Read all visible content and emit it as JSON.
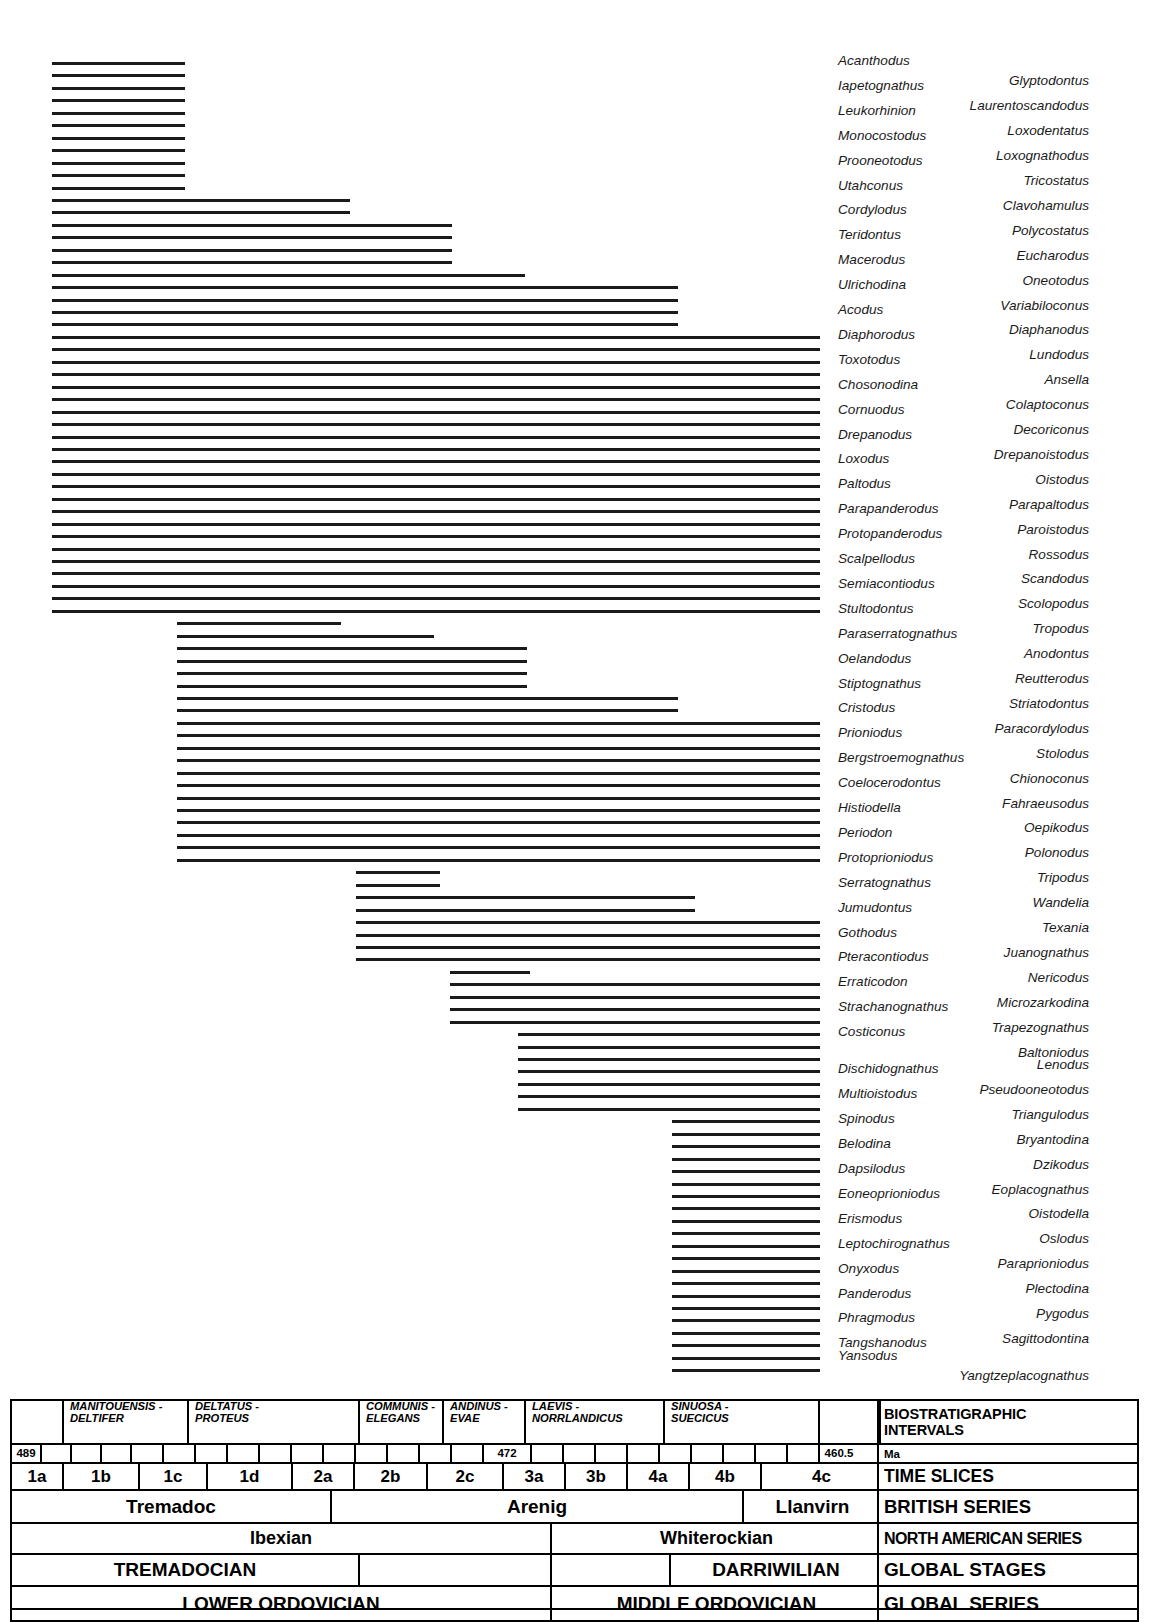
{
  "chart_data": {
    "type": "range-chart",
    "xlabel": "Time Slices",
    "x_axis_px": {
      "left": 52,
      "right": 1139
    },
    "axis_ma": [
      489,
      472,
      460.5
    ],
    "taxa": [
      {
        "name": "Acanthodus",
        "column": "left",
        "start": 52,
        "end": 185
      },
      {
        "name": "Glyptodontus",
        "column": "right",
        "start": 52,
        "end": 185
      },
      {
        "name": "Iapetognathus",
        "column": "left",
        "start": 52,
        "end": 185
      },
      {
        "name": "Laurentoscandodus",
        "column": "right",
        "start": 52,
        "end": 185
      },
      {
        "name": "Leukorhinion",
        "column": "left",
        "start": 52,
        "end": 185
      },
      {
        "name": "Loxodentatus",
        "column": "right",
        "start": 52,
        "end": 185
      },
      {
        "name": "Monocostodus",
        "column": "left",
        "start": 52,
        "end": 185
      },
      {
        "name": "Loxognathodus",
        "column": "right",
        "start": 52,
        "end": 185
      },
      {
        "name": "Prooneotodus",
        "column": "left",
        "start": 52,
        "end": 185
      },
      {
        "name": "Tricostatus",
        "column": "right",
        "start": 52,
        "end": 185
      },
      {
        "name": "Utahconus",
        "column": "left",
        "start": 52,
        "end": 185
      },
      {
        "name": "Clavohamulus",
        "column": "right",
        "start": 52,
        "end": 350
      },
      {
        "name": "Cordylodus",
        "column": "left",
        "start": 52,
        "end": 350
      },
      {
        "name": "Polycostatus",
        "column": "right",
        "start": 52,
        "end": 452
      },
      {
        "name": "Teridontus",
        "column": "left",
        "start": 52,
        "end": 452
      },
      {
        "name": "Eucharodus",
        "column": "right",
        "start": 52,
        "end": 452
      },
      {
        "name": "Macerodus",
        "column": "left",
        "start": 52,
        "end": 452
      },
      {
        "name": "Oneotodus",
        "column": "right",
        "start": 52,
        "end": 525
      },
      {
        "name": "Ulrichodina",
        "column": "left",
        "start": 52,
        "end": 678
      },
      {
        "name": "Variabiloconus",
        "column": "right",
        "start": 52,
        "end": 678
      },
      {
        "name": "Acodus",
        "column": "left",
        "start": 52,
        "end": 678
      },
      {
        "name": "Diaphanodus",
        "column": "right",
        "start": 52,
        "end": 678
      },
      {
        "name": "Diaphorodus",
        "column": "left",
        "start": 52,
        "end": 820
      },
      {
        "name": "Lundodus",
        "column": "right",
        "start": 52,
        "end": 820
      },
      {
        "name": "Toxotodus",
        "column": "left",
        "start": 52,
        "end": 820
      },
      {
        "name": "Ansella",
        "column": "right",
        "start": 52,
        "end": 820
      },
      {
        "name": "Chosonodina",
        "column": "left",
        "start": 52,
        "end": 820
      },
      {
        "name": "Colaptoconus",
        "column": "right",
        "start": 52,
        "end": 820
      },
      {
        "name": "Cornuodus",
        "column": "left",
        "start": 52,
        "end": 820
      },
      {
        "name": "Decoriconus",
        "column": "right",
        "start": 52,
        "end": 820
      },
      {
        "name": "Drepanodus",
        "column": "left",
        "start": 52,
        "end": 820
      },
      {
        "name": "Drepanoistodus",
        "column": "right",
        "start": 52,
        "end": 820
      },
      {
        "name": "Loxodus",
        "column": "left",
        "start": 52,
        "end": 820
      },
      {
        "name": "Oistodus",
        "column": "right",
        "start": 52,
        "end": 820
      },
      {
        "name": "Paltodus",
        "column": "left",
        "start": 52,
        "end": 820
      },
      {
        "name": "Parapaltodus",
        "column": "right",
        "start": 52,
        "end": 820
      },
      {
        "name": "Parapanderodus",
        "column": "left",
        "start": 52,
        "end": 820
      },
      {
        "name": "Paroistodus",
        "column": "right",
        "start": 52,
        "end": 820
      },
      {
        "name": "Protopanderodus",
        "column": "left",
        "start": 52,
        "end": 820
      },
      {
        "name": "Rossodus",
        "column": "right",
        "start": 52,
        "end": 820
      },
      {
        "name": "Scalpellodus",
        "column": "left",
        "start": 52,
        "end": 820
      },
      {
        "name": "Scandodus",
        "column": "right",
        "start": 52,
        "end": 820
      },
      {
        "name": "Semiacontiodus",
        "column": "left",
        "start": 52,
        "end": 820
      },
      {
        "name": "Scolopodus",
        "column": "right",
        "start": 52,
        "end": 820
      },
      {
        "name": "Stultodontus",
        "column": "left",
        "start": 52,
        "end": 820
      },
      {
        "name": "Tropodus",
        "column": "right",
        "start": 177,
        "end": 341
      },
      {
        "name": "Paraserratognathus",
        "column": "left",
        "start": 177,
        "end": 434
      },
      {
        "name": "Anodontus",
        "column": "right",
        "start": 177,
        "end": 527
      },
      {
        "name": "Oelandodus",
        "column": "left",
        "start": 177,
        "end": 527
      },
      {
        "name": "Reutterodus",
        "column": "right",
        "start": 177,
        "end": 527
      },
      {
        "name": "Stiptognathus",
        "column": "left",
        "start": 177,
        "end": 527
      },
      {
        "name": "Striatodontus",
        "column": "right",
        "start": 177,
        "end": 678
      },
      {
        "name": "Cristodus",
        "column": "left",
        "start": 177,
        "end": 678
      },
      {
        "name": "Paracordylodus",
        "column": "right",
        "start": 177,
        "end": 820
      },
      {
        "name": "Prioniodus",
        "column": "left",
        "start": 177,
        "end": 820
      },
      {
        "name": "Stolodus",
        "column": "right",
        "start": 177,
        "end": 820
      },
      {
        "name": "Bergstroemognathus",
        "column": "left",
        "start": 177,
        "end": 820
      },
      {
        "name": "Chionoconus",
        "column": "right",
        "start": 177,
        "end": 820
      },
      {
        "name": "Coelocerodontus",
        "column": "left",
        "start": 177,
        "end": 820
      },
      {
        "name": "Fahraeusodus",
        "column": "right",
        "start": 177,
        "end": 820
      },
      {
        "name": "Histiodella",
        "column": "left",
        "start": 177,
        "end": 820
      },
      {
        "name": "Oepikodus",
        "column": "right",
        "start": 177,
        "end": 820
      },
      {
        "name": "Periodon",
        "column": "left",
        "start": 177,
        "end": 820
      },
      {
        "name": "Polonodus",
        "column": "right",
        "start": 177,
        "end": 820
      },
      {
        "name": "Protoprioniodus",
        "column": "left",
        "start": 177,
        "end": 820
      },
      {
        "name": "Tripodus",
        "column": "right",
        "start": 356,
        "end": 440
      },
      {
        "name": "Serratognathus",
        "column": "left",
        "start": 356,
        "end": 440
      },
      {
        "name": "Wandelia",
        "column": "right",
        "start": 356,
        "end": 695
      },
      {
        "name": "Jumudontus",
        "column": "left",
        "start": 356,
        "end": 695
      },
      {
        "name": "Texania",
        "column": "right",
        "start": 356,
        "end": 820
      },
      {
        "name": "Gothodus",
        "column": "left",
        "start": 356,
        "end": 820
      },
      {
        "name": "Juanognathus",
        "column": "right",
        "start": 356,
        "end": 820
      },
      {
        "name": "Pteracontiodus",
        "column": "left",
        "start": 356,
        "end": 820
      },
      {
        "name": "Nericodus",
        "column": "right",
        "start": 450,
        "end": 530
      },
      {
        "name": "Erraticodon",
        "column": "left",
        "start": 450,
        "end": 820
      },
      {
        "name": "Microzarkodina",
        "column": "right",
        "start": 450,
        "end": 820
      },
      {
        "name": "Strachanognathus",
        "column": "left",
        "start": 450,
        "end": 820
      },
      {
        "name": "Trapezognathus",
        "column": "right",
        "start": 450,
        "end": 820
      },
      {
        "name": "Costiconus",
        "column": "left",
        "start": 518,
        "end": 820
      },
      {
        "name": "Baltoniodus",
        "column": "right",
        "start": 518,
        "end": 820
      },
      {
        "name": "Lenodus",
        "column": "right",
        "start": 518,
        "end": 820
      },
      {
        "name": "Dischidognathus",
        "column": "left",
        "start": 518,
        "end": 820
      },
      {
        "name": "Pseudooneotodus",
        "column": "right",
        "start": 518,
        "end": 820
      },
      {
        "name": "Multioistodus",
        "column": "left",
        "start": 518,
        "end": 820
      },
      {
        "name": "Triangulodus",
        "column": "right",
        "start": 518,
        "end": 820
      },
      {
        "name": "Spinodus",
        "column": "left",
        "start": 672,
        "end": 820
      },
      {
        "name": "Bryantodina",
        "column": "right",
        "start": 672,
        "end": 820
      },
      {
        "name": "Belodina",
        "column": "left",
        "start": 672,
        "end": 820
      },
      {
        "name": "Dzikodus",
        "column": "right",
        "start": 672,
        "end": 820
      },
      {
        "name": "Dapsilodus",
        "column": "left",
        "start": 672,
        "end": 820
      },
      {
        "name": "Eoplacognathus",
        "column": "right",
        "start": 672,
        "end": 820
      },
      {
        "name": "Eoneoprioniodus",
        "column": "left",
        "start": 672,
        "end": 820
      },
      {
        "name": "Oistodella",
        "column": "right",
        "start": 672,
        "end": 820
      },
      {
        "name": "Erismodus",
        "column": "left",
        "start": 672,
        "end": 820
      },
      {
        "name": "Oslodus",
        "column": "right",
        "start": 672,
        "end": 820
      },
      {
        "name": "Leptochirognathus",
        "column": "left",
        "start": 672,
        "end": 820
      },
      {
        "name": "Paraprioniodus",
        "column": "right",
        "start": 672,
        "end": 820
      },
      {
        "name": "Onyxodus",
        "column": "left",
        "start": 672,
        "end": 820
      },
      {
        "name": "Plectodina",
        "column": "right",
        "start": 672,
        "end": 820
      },
      {
        "name": "Panderodus",
        "column": "left",
        "start": 672,
        "end": 820
      },
      {
        "name": "Pygodus",
        "column": "right",
        "start": 672,
        "end": 820
      },
      {
        "name": "Phragmodus",
        "column": "left",
        "start": 672,
        "end": 820
      },
      {
        "name": "Sagittodontina",
        "column": "right",
        "start": 672,
        "end": 820
      },
      {
        "name": "Tangshanodus",
        "column": "left",
        "start": 672,
        "end": 820
      },
      {
        "name": "Yansodus",
        "column": "left",
        "start": 672,
        "end": 820
      },
      {
        "name": "Yangtzeplacognathus",
        "column": "right",
        "start": 672,
        "end": 820
      }
    ]
  },
  "chrono": {
    "rows": [
      {
        "id": "biostratigraphic-intervals",
        "label": "BIOSTRATIGRAPHIC INTERVALS",
        "label_lines": [
          "BIOSTRATIGRAPHIC",
          "INTERVALS"
        ],
        "cells": [
          {
            "text": "",
            "lines": [],
            "w": 52
          },
          {
            "text": "MANITOUENSIS - DELTIFER",
            "lines": [
              "MANITOUENSIS -",
              "DELTIFER"
            ],
            "w": 125
          },
          {
            "text": "DELTATUS - PROTEUS",
            "lines": [
              "DELTATUS -",
              "PROTEUS"
            ],
            "w": 171
          },
          {
            "text": "COMMUNIS - ELEGANS",
            "lines": [
              "COMMUNIS -",
              "ELEGANS"
            ],
            "w": 84
          },
          {
            "text": "ANDINUS - EVAE",
            "lines": [
              "ANDINUS -",
              "EVAE"
            ],
            "w": 82
          },
          {
            "text": "LAEVIS - NORRLANDICUS",
            "lines": [
              "LAEVIS -",
              "NORRLANDICUS"
            ],
            "w": 139
          },
          {
            "text": "SINUOSA - SUECICUS",
            "lines": [
              "SINUOSA -",
              "SUECICUS"
            ],
            "w": 155
          },
          {
            "text": "",
            "lines": [],
            "w": 61
          }
        ]
      },
      {
        "id": "ma",
        "label": "Ma",
        "label_lines": [
          "Ma"
        ],
        "cells": [
          {
            "text": "489",
            "w": 30
          },
          {
            "text": "",
            "w": 30
          },
          {
            "text": "",
            "w": 30
          },
          {
            "text": "",
            "w": 30
          },
          {
            "text": "",
            "w": 32
          },
          {
            "text": "",
            "w": 32
          },
          {
            "text": "",
            "w": 32
          },
          {
            "text": "",
            "w": 32
          },
          {
            "text": "",
            "w": 32
          },
          {
            "text": "",
            "w": 32
          },
          {
            "text": "",
            "w": 32
          },
          {
            "text": "",
            "w": 32
          },
          {
            "text": "",
            "w": 32
          },
          {
            "text": "",
            "w": 32
          },
          {
            "text": "",
            "w": 32
          },
          {
            "text": "472",
            "w": 48
          },
          {
            "text": "",
            "w": 32
          },
          {
            "text": "",
            "w": 32
          },
          {
            "text": "",
            "w": 32
          },
          {
            "text": "",
            "w": 32
          },
          {
            "text": "",
            "w": 32
          },
          {
            "text": "",
            "w": 32
          },
          {
            "text": "",
            "w": 32
          },
          {
            "text": "",
            "w": 32
          },
          {
            "text": "",
            "w": 32
          },
          {
            "text": "460.5",
            "w": 38
          }
        ]
      },
      {
        "id": "time-slices",
        "label": "TIME SLICES",
        "label_lines": [
          "TIME SLICES"
        ],
        "cells": [
          {
            "text": "1a",
            "w": 52
          },
          {
            "text": "1b",
            "w": 76
          },
          {
            "text": "1c",
            "w": 68
          },
          {
            "text": "1d",
            "w": 85
          },
          {
            "text": "2a",
            "w": 62
          },
          {
            "text": "2b",
            "w": 73
          },
          {
            "text": "2c",
            "w": 76
          },
          {
            "text": "3a",
            "w": 62
          },
          {
            "text": "3b",
            "w": 62
          },
          {
            "text": "4a",
            "w": 62
          },
          {
            "text": "4b",
            "w": 72
          },
          {
            "text": "4c",
            "w": 119
          }
        ]
      },
      {
        "id": "british-series",
        "label": "BRITISH SERIES",
        "label_lines": [
          "BRITISH SERIES"
        ],
        "cells": [
          {
            "text": "Tremadoc",
            "w": 320
          },
          {
            "text": "Arenig",
            "w": 412
          },
          {
            "text": "Llanvirn",
            "w": 137
          }
        ]
      },
      {
        "id": "north-american-series",
        "label": "NORTH AMERICAN SERIES",
        "label_lines": [
          "NORTH AMERICAN SERIES"
        ],
        "cells": [
          {
            "text": "Ibexian",
            "w": 540
          },
          {
            "text": "Whiterockian",
            "w": 329
          }
        ]
      },
      {
        "id": "global-stages",
        "label": "GLOBAL STAGES",
        "label_lines": [
          "GLOBAL STAGES"
        ],
        "cells": [
          {
            "text": "TREMADOCIAN",
            "w": 348
          },
          {
            "text": "",
            "w": 192
          },
          {
            "text": "",
            "w": 119
          },
          {
            "text": "DARRIWILIAN",
            "w": 210
          }
        ]
      },
      {
        "id": "global-series",
        "label": "GLOBAL SERIES",
        "label_lines": [
          "GLOBAL SERIES"
        ],
        "cells": [
          {
            "text": "LOWER ORDOVICIAN",
            "w": 540
          },
          {
            "text": "MIDDLE ORDOVICIAN",
            "w": 329
          }
        ]
      }
    ],
    "label_column_width": 260
  }
}
